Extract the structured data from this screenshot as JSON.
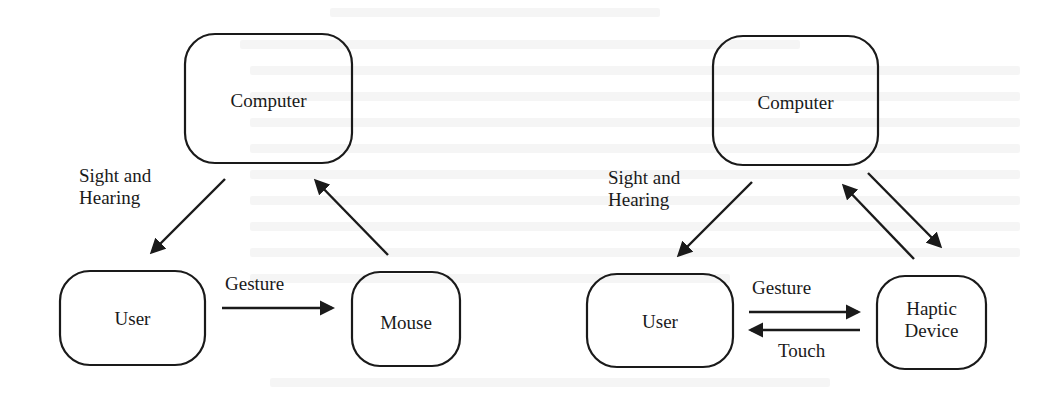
{
  "figure": {
    "left_diagram": {
      "name": "conventional-interaction",
      "nodes": [
        {
          "id": "computer",
          "label": "Computer"
        },
        {
          "id": "user",
          "label": "User"
        },
        {
          "id": "mouse",
          "label": "Mouse"
        }
      ],
      "edges": [
        {
          "from": "computer",
          "to": "user",
          "label_line1": "Sight and",
          "label_line2": "Hearing"
        },
        {
          "from": "user",
          "to": "mouse",
          "label": "Gesture"
        },
        {
          "from": "mouse",
          "to": "computer",
          "label": ""
        }
      ]
    },
    "right_diagram": {
      "name": "haptic-interaction",
      "nodes": [
        {
          "id": "computer",
          "label": "Computer"
        },
        {
          "id": "user",
          "label": "User"
        },
        {
          "id": "haptic",
          "label_line1": "Haptic",
          "label_line2": "Device"
        }
      ],
      "edges": [
        {
          "from": "computer",
          "to": "user",
          "label_line1": "Sight and",
          "label_line2": "Hearing"
        },
        {
          "from": "user",
          "to": "haptic",
          "label": "Gesture"
        },
        {
          "from": "haptic",
          "to": "user",
          "label": "Touch"
        },
        {
          "from": "haptic",
          "to": "computer",
          "label": ""
        },
        {
          "from": "computer",
          "to": "haptic",
          "label": ""
        }
      ]
    },
    "colors": {
      "ink": "#1a1a1a",
      "paper": "#ffffff",
      "bleed": "#ececec"
    }
  }
}
